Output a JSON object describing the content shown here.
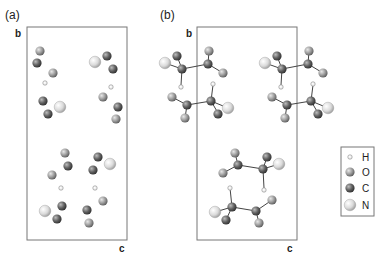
{
  "panels": [
    {
      "label": "(a)",
      "axis_top": "b",
      "axis_bottom": "c"
    },
    {
      "label": "(b)",
      "axis_top": "b",
      "axis_bottom": "c"
    }
  ],
  "legend": {
    "items": [
      {
        "symbol": "H",
        "label": "H"
      },
      {
        "symbol": "O",
        "label": "O"
      },
      {
        "symbol": "C",
        "label": "C"
      },
      {
        "symbol": "N",
        "label": "N"
      }
    ]
  },
  "colors": {
    "H": "#ffffff",
    "O": "#9a9a9a",
    "C": "#5e5e5e",
    "N": "#d8d8d8",
    "frame": "#777777"
  }
}
